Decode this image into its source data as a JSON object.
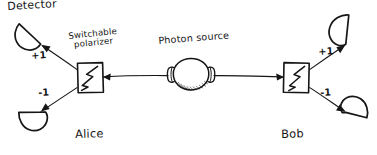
{
  "diagram": {
    "style": "hand-drawn pen sketch on white paper",
    "ink_color": "#141414",
    "background_color": "#ffffff"
  },
  "labels": {
    "detector": "Detector",
    "switchable_polarizer_line1": "Switchable",
    "switchable_polarizer_line2": "polarizer",
    "photon_source": "Photon source",
    "alice": "Alice",
    "bob": "Bob"
  },
  "outcomes": {
    "alice_plus": "+1",
    "alice_minus": "-1",
    "bob_plus": "+1",
    "bob_minus": "-1"
  },
  "nodes": {
    "photon_source": {
      "name": "photon-source",
      "shape": "shaded sphere with two conical emitters"
    },
    "alice_polarizer": {
      "name": "alice-polarizer",
      "shape": "square box with zigzag"
    },
    "bob_polarizer": {
      "name": "bob-polarizer",
      "shape": "square box with zigzag"
    },
    "detectors": [
      {
        "name": "alice-detector-plus",
        "position": "top-left"
      },
      {
        "name": "alice-detector-minus",
        "position": "bottom-left"
      },
      {
        "name": "bob-detector-plus",
        "position": "top-right"
      },
      {
        "name": "bob-detector-minus",
        "position": "bottom-right"
      }
    ]
  }
}
